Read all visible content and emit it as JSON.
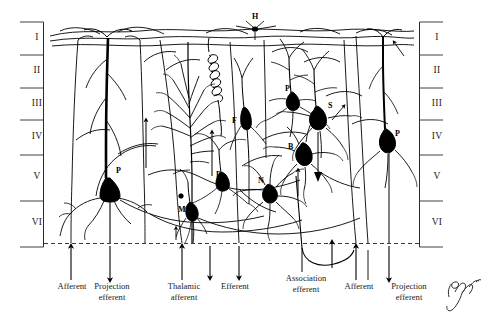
{
  "figure": {
    "kind": "neuroanatomy-line-drawing",
    "ink_color": "#000000",
    "background_color": "#ffffff",
    "signature": "Pamara"
  },
  "layers": {
    "left_labels": [
      "I",
      "II",
      "III",
      "IV",
      "V",
      "VI"
    ],
    "right_labels": [
      "I",
      "II",
      "III",
      "IV",
      "V",
      "VI"
    ]
  },
  "cell_labels": [
    {
      "id": "h-top",
      "text": "H"
    },
    {
      "id": "p-left",
      "text": "P"
    },
    {
      "id": "f-mid",
      "text": "F"
    },
    {
      "id": "p-mid",
      "text": "P"
    },
    {
      "id": "m-mid",
      "text": "M"
    },
    {
      "id": "n-mid",
      "text": "N"
    },
    {
      "id": "p-upper-right",
      "text": "P"
    },
    {
      "id": "b-right",
      "text": "B"
    },
    {
      "id": "s-right",
      "text": "S"
    },
    {
      "id": "p-right",
      "text": "P"
    }
  ],
  "pathway_labels": [
    {
      "id": "afferent-1",
      "text": "Afferent"
    },
    {
      "id": "projection-efferent-1",
      "text": "Projection\nefferent"
    },
    {
      "id": "thalamic-afferent",
      "text": "Thalamic\nafferent"
    },
    {
      "id": "efferent",
      "text": "Efferent"
    },
    {
      "id": "association-efferent",
      "text": "Association\nefferent"
    },
    {
      "id": "afferent-2",
      "text": "Afferent"
    },
    {
      "id": "projection-efferent-2",
      "text": "Projection\nefferent"
    }
  ]
}
